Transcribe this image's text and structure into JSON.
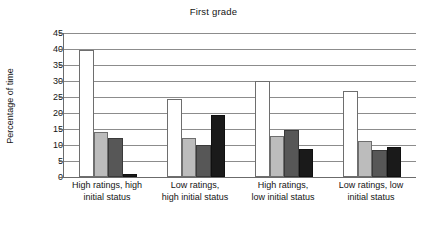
{
  "chart_data": {
    "type": "bar",
    "title": "First grade",
    "xlabel": "",
    "ylabel": "Percentage of time",
    "ylim": [
      0,
      45
    ],
    "ytick_step": 5,
    "yticks": [
      45,
      40,
      35,
      30,
      25,
      20,
      15,
      10,
      5,
      0
    ],
    "grid": true,
    "legend": "none",
    "categories": [
      "High ratings, high initial status",
      "Low ratings, high initial status",
      "High ratings, low initial status",
      "Low ratings, low initial status"
    ],
    "category_lines": [
      [
        "High ratings, high",
        "initial status"
      ],
      [
        "Low ratings,",
        "high initial status"
      ],
      [
        "High ratings,",
        "low initial status"
      ],
      [
        "Low ratings, low",
        "initial status"
      ]
    ],
    "series": [
      {
        "name": "series-1",
        "color": "#ffffff",
        "values": [
          39.8,
          24.4,
          29.9,
          27.0
        ]
      },
      {
        "name": "series-2",
        "color": "#bcbcbc",
        "values": [
          14.1,
          12.1,
          12.7,
          11.1
        ]
      },
      {
        "name": "series-3",
        "color": "#575757",
        "values": [
          12.1,
          9.9,
          14.7,
          8.4
        ]
      },
      {
        "name": "series-4",
        "color": "#1a1a1a",
        "values": [
          1.0,
          19.3,
          8.8,
          9.5
        ]
      }
    ]
  },
  "colors": {
    "background": "#ffffff",
    "text": "#141414",
    "gridline": "#8c8c8c",
    "axis": "#6b6b6b"
  }
}
